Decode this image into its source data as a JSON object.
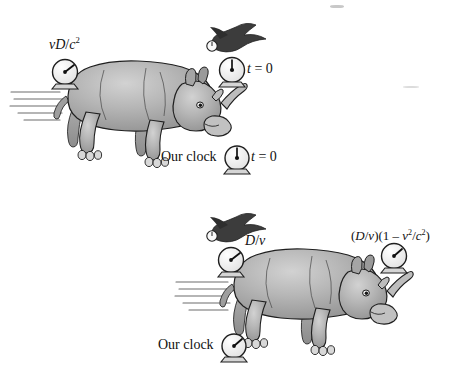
{
  "figure": {
    "background_color": "#ffffff",
    "width": 459,
    "height": 373,
    "body_color": "#b0b0b0",
    "body_shadow_color": "#8f8f8f",
    "body_highlight_color": "#cdcdcd",
    "outline_color": "#1a1a1a",
    "clock_face_color": "#fdfdfd",
    "bird_color": "#3a3a3a",
    "speed_line_color": "#6d6d6d"
  },
  "panels": [
    {
      "id": "panel-top",
      "name": "top-panel",
      "rhino_label": "rhinoceros-running-left",
      "bird_label": "bird-flying-with-clock",
      "speed_lines": 5,
      "labels": {
        "rear_clock": {
          "text_parts": [
            "vD",
            "/",
            "c",
            "2"
          ],
          "plain": "vD/c2",
          "display": "vD/c²"
        },
        "front_clock": {
          "display": "t = 0",
          "var": "t",
          "value": "0"
        },
        "our_clock_name": "Our clock",
        "our_clock_reading": {
          "display": "t = 0",
          "var": "t",
          "value": "0"
        }
      },
      "clocks": [
        {
          "name": "rear-clock",
          "hand_angle_deg": 55,
          "reads": "vD/c²"
        },
        {
          "name": "front-clock",
          "hand_angle_deg": 0,
          "reads": "t = 0"
        },
        {
          "name": "our-clock",
          "hand_angle_deg": 0,
          "reads": "t = 0"
        },
        {
          "name": "bird-clock",
          "hand_angle_deg": 0,
          "reads": ""
        }
      ]
    },
    {
      "id": "panel-bottom",
      "name": "bottom-panel",
      "rhino_label": "rhinoceros-running-left",
      "bird_label": "bird-flying-with-clock",
      "speed_lines": 5,
      "labels": {
        "rear_clock": {
          "plain": "D/v",
          "display": "D/v"
        },
        "front_clock": {
          "plain": "(D/v)(1 - v2/c2)",
          "display": "(D/v)(1 – v²/c²)"
        },
        "our_clock_name": "Our clock"
      },
      "clocks": [
        {
          "name": "rear-clock",
          "hand_angle_deg": 55,
          "reads": "D/v"
        },
        {
          "name": "front-clock",
          "hand_angle_deg": 35,
          "reads": "(D/v)(1 – v²/c²)"
        },
        {
          "name": "our-clock",
          "hand_angle_deg": 45,
          "reads": ""
        },
        {
          "name": "bird-clock",
          "hand_angle_deg": 0,
          "reads": ""
        }
      ]
    }
  ]
}
